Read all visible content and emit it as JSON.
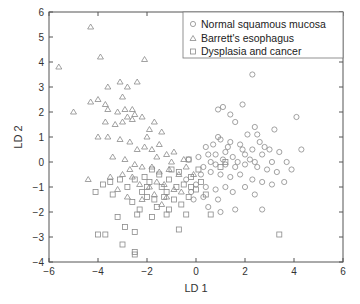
{
  "chart_data": {
    "type": "scatter",
    "title": "",
    "xlabel": "LD 1",
    "ylabel": "LD 2",
    "xlim": [
      -6,
      6
    ],
    "ylim": [
      -4,
      6
    ],
    "xticks": [
      -6,
      -4,
      -2,
      0,
      2,
      4,
      6
    ],
    "yticks": [
      -4,
      -3,
      -2,
      -1,
      0,
      1,
      2,
      3,
      4,
      5,
      6
    ],
    "grid": false,
    "legend_position": "upper right",
    "series": [
      {
        "name": "Normal squamous mucosa",
        "marker": "circle",
        "color": "#8a8a8a",
        "points": [
          [
            2.3,
            3.5
          ],
          [
            0.9,
            2.1
          ],
          [
            1.1,
            2.2
          ],
          [
            1.9,
            2.3
          ],
          [
            1.4,
            1.9
          ],
          [
            1.6,
            1.6
          ],
          [
            2.4,
            1.4
          ],
          [
            3.2,
            1.3
          ],
          [
            4.1,
            1.8
          ],
          [
            2.1,
            1.1
          ],
          [
            2.5,
            1.1
          ],
          [
            0.9,
            1.0
          ],
          [
            1.4,
            0.8
          ],
          [
            2.6,
            0.8
          ],
          [
            3.0,
            0.5
          ],
          [
            4.3,
            0.5
          ],
          [
            3.7,
            0.0
          ],
          [
            3.1,
            0.0
          ],
          [
            2.8,
            0.6
          ],
          [
            1.8,
            0.7
          ],
          [
            1.0,
            0.9
          ],
          [
            0.4,
            0.6
          ],
          [
            0.5,
            0.3
          ],
          [
            0.8,
            0.3
          ],
          [
            1.2,
            0.4
          ],
          [
            1.5,
            0.2
          ],
          [
            2.0,
            0.3
          ],
          [
            2.3,
            0.5
          ],
          [
            2.7,
            0.3
          ],
          [
            3.4,
            0.4
          ],
          [
            3.9,
            -0.3
          ],
          [
            2.9,
            -0.3
          ],
          [
            2.5,
            -0.2
          ],
          [
            2.0,
            -0.1
          ],
          [
            1.6,
            -0.2
          ],
          [
            1.2,
            -0.1
          ],
          [
            0.8,
            -0.1
          ],
          [
            0.3,
            -0.2
          ],
          [
            0.1,
            0.2
          ],
          [
            -0.3,
            0.1
          ],
          [
            0.2,
            -0.5
          ],
          [
            0.6,
            -0.4
          ],
          [
            1.0,
            -0.5
          ],
          [
            1.4,
            -0.6
          ],
          [
            1.8,
            -0.5
          ],
          [
            2.3,
            -0.7
          ],
          [
            2.7,
            -0.8
          ],
          [
            3.1,
            -0.9
          ],
          [
            3.6,
            -0.8
          ],
          [
            1.2,
            -1.0
          ],
          [
            0.8,
            -1.1
          ],
          [
            0.4,
            -1.0
          ],
          [
            0.0,
            -0.9
          ],
          [
            -0.4,
            -0.7
          ],
          [
            -0.2,
            -1.2
          ],
          [
            0.3,
            -1.4
          ],
          [
            0.9,
            -1.5
          ],
          [
            1.5,
            -1.2
          ],
          [
            2.0,
            -1.0
          ],
          [
            2.4,
            -1.3
          ],
          [
            1.0,
            -2.0
          ],
          [
            1.6,
            -1.9
          ],
          [
            2.7,
            -1.9
          ],
          [
            0.5,
            -1.8
          ],
          [
            -0.1,
            -1.5
          ],
          [
            0.6,
            0.0
          ],
          [
            1.1,
            0.1
          ],
          [
            1.7,
            0.0
          ],
          [
            2.2,
            0.1
          ],
          [
            1.3,
            0.6
          ],
          [
            0.7,
            0.7
          ],
          [
            1.9,
            0.5
          ],
          [
            2.4,
            0.0
          ],
          [
            3.3,
            -0.4
          ]
        ]
      },
      {
        "name": "Barrett's esophagus",
        "marker": "triangle",
        "color": "#8a8a8a",
        "points": [
          [
            -4.3,
            5.4
          ],
          [
            -5.6,
            3.8
          ],
          [
            -2.1,
            4.1
          ],
          [
            -3.1,
            3.2
          ],
          [
            -2.4,
            3.2
          ],
          [
            -3.7,
            2.3
          ],
          [
            -3.6,
            2.1
          ],
          [
            -3.2,
            2.0
          ],
          [
            -2.9,
            2.1
          ],
          [
            -2.6,
            2.1
          ],
          [
            -2.5,
            1.9
          ],
          [
            -5.0,
            2.0
          ],
          [
            -4.3,
            2.4
          ],
          [
            -4.0,
            2.5
          ],
          [
            -3.7,
            1.6
          ],
          [
            -3.3,
            1.5
          ],
          [
            -3.0,
            1.6
          ],
          [
            -2.8,
            1.8
          ],
          [
            -2.6,
            1.7
          ],
          [
            -2.2,
            1.8
          ],
          [
            -1.9,
            1.3
          ],
          [
            -1.7,
            1.6
          ],
          [
            -4.0,
            1.0
          ],
          [
            -3.6,
            1.0
          ],
          [
            -3.1,
            0.9
          ],
          [
            -2.7,
            0.8
          ],
          [
            -2.4,
            0.5
          ],
          [
            -2.1,
            0.6
          ],
          [
            -1.8,
            0.5
          ],
          [
            -1.5,
            0.7
          ],
          [
            -1.2,
            0.3
          ],
          [
            -0.9,
            0.4
          ],
          [
            -3.4,
            0.2
          ],
          [
            -2.9,
            0.1
          ],
          [
            -2.5,
            -0.1
          ],
          [
            -2.2,
            -0.2
          ],
          [
            -1.8,
            -0.2
          ],
          [
            -1.5,
            -0.4
          ],
          [
            -1.1,
            -0.3
          ],
          [
            -0.7,
            -0.5
          ],
          [
            -0.4,
            -0.2
          ],
          [
            -0.1,
            -0.5
          ],
          [
            -4.4,
            -0.7
          ],
          [
            -3.5,
            -0.6
          ],
          [
            -3.0,
            -0.5
          ],
          [
            -2.6,
            -0.6
          ],
          [
            -2.3,
            -0.9
          ],
          [
            -1.9,
            -1.0
          ],
          [
            -1.6,
            -0.8
          ],
          [
            -1.3,
            -0.9
          ],
          [
            -0.9,
            -1.1
          ],
          [
            -2.8,
            -1.4
          ],
          [
            -2.2,
            -1.5
          ],
          [
            -1.7,
            -1.3
          ],
          [
            -1.2,
            -1.4
          ],
          [
            -0.6,
            -1.2
          ],
          [
            -3.9,
            4.2
          ],
          [
            -3.6,
            3.0
          ],
          [
            -2.8,
            3.0
          ],
          [
            -3.0,
            2.6
          ],
          [
            -1.4,
            1.2
          ],
          [
            -2.0,
            1.0
          ],
          [
            -1.6,
            0.2
          ],
          [
            -1.0,
            0.0
          ],
          [
            -0.5,
            0.1
          ],
          [
            -2.7,
            -0.3
          ],
          [
            -3.2,
            -1.1
          ],
          [
            -1.4,
            -1.7
          ]
        ]
      },
      {
        "name": "Dysplasia and cancer",
        "marker": "square",
        "color": "#8a8a8a",
        "points": [
          [
            -3.8,
            -0.9
          ],
          [
            -3.5,
            -0.8
          ],
          [
            -3.1,
            -0.7
          ],
          [
            -2.8,
            -1.0
          ],
          [
            -2.5,
            -0.7
          ],
          [
            -2.2,
            -1.2
          ],
          [
            -1.9,
            -0.8
          ],
          [
            -1.7,
            -1.5
          ],
          [
            -1.4,
            -1.0
          ],
          [
            -1.1,
            -0.7
          ],
          [
            -0.8,
            -1.0
          ],
          [
            -0.5,
            -0.9
          ],
          [
            -0.2,
            -0.6
          ],
          [
            0.0,
            -1.1
          ],
          [
            -2.6,
            -1.6
          ],
          [
            -2.3,
            -1.9
          ],
          [
            -2.0,
            -1.4
          ],
          [
            -1.6,
            -1.8
          ],
          [
            -1.3,
            -1.4
          ],
          [
            -0.9,
            -1.5
          ],
          [
            -0.6,
            -1.7
          ],
          [
            -0.3,
            -1.4
          ],
          [
            -3.2,
            -2.2
          ],
          [
            -2.9,
            -2.6
          ],
          [
            -2.5,
            -2.8
          ],
          [
            -2.4,
            -2.1
          ],
          [
            -1.8,
            -2.2
          ],
          [
            -1.2,
            -2.1
          ],
          [
            -0.4,
            -2.1
          ],
          [
            -0.7,
            -2.7
          ],
          [
            -4.0,
            -2.9
          ],
          [
            -3.7,
            -2.9
          ],
          [
            -3.0,
            -3.3
          ],
          [
            -2.5,
            -3.6
          ],
          [
            -2.5,
            -3.7
          ],
          [
            -1.2,
            -1.2
          ],
          [
            -1.0,
            -0.3
          ],
          [
            -0.7,
            -0.4
          ],
          [
            -2.1,
            -0.6
          ],
          [
            -1.5,
            -0.5
          ],
          [
            -0.3,
            0.1
          ],
          [
            0.1,
            -0.3
          ],
          [
            0.4,
            -1.3
          ],
          [
            0.6,
            -2.1
          ],
          [
            1.0,
            -0.2
          ],
          [
            1.2,
            0.0
          ],
          [
            -4.1,
            -1.2
          ],
          [
            -3.4,
            -1.3
          ],
          [
            -2.0,
            -1.0
          ],
          [
            -1.1,
            -1.9
          ],
          [
            -0.2,
            -1.0
          ],
          [
            0.2,
            -0.8
          ],
          [
            3.4,
            -2.9
          ],
          [
            -1.8,
            -0.3
          ]
        ]
      }
    ]
  },
  "chart": {
    "xlabel": "LD 1",
    "ylabel": "LD 2",
    "legend": [
      {
        "label": "Normal squamous mucosa",
        "marker": "circle"
      },
      {
        "label": "Barrett's esophagus",
        "marker": "triangle"
      },
      {
        "label": "Dysplasia and cancer",
        "marker": "square"
      }
    ],
    "colors": {
      "frame": "#555555",
      "marker": "#8a8a8a",
      "text": "#333333",
      "legend_border": "#777777"
    }
  }
}
